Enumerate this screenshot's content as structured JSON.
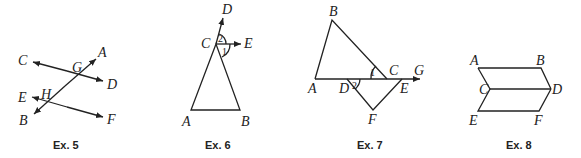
{
  "figures": [
    {
      "id": "ex5",
      "caption": "Ex. 5",
      "description": "Two lines CD and EF crossed by transversal AB at G and H",
      "labels": {
        "A": "A",
        "B": "B",
        "C": "C",
        "D": "D",
        "E": "E",
        "F": "F",
        "G": "G",
        "H": "H"
      }
    },
    {
      "id": "ex6",
      "caption": "Ex. 6",
      "description": "Triangle ABC with ray CD extending AC and ray CE; angles 1 and 2 at C",
      "labels": {
        "A": "A",
        "B": "B",
        "C": "C",
        "D": "D",
        "E": "E"
      },
      "angles": {
        "one": "1",
        "two": "2"
      }
    },
    {
      "id": "ex7",
      "caption": "Ex. 7",
      "description": "Triangle ABC and triangle DEF on ray AG; angle 1 at C, angle 2 at D",
      "labels": {
        "A": "A",
        "B": "B",
        "C": "C",
        "D": "D",
        "E": "E",
        "F": "F",
        "G": "G"
      },
      "angles": {
        "one": "1",
        "two": "2"
      }
    },
    {
      "id": "ex8",
      "caption": "Ex. 8",
      "description": "Two parallelograms ABDC and CDFE sharing side CD",
      "labels": {
        "A": "A",
        "B": "B",
        "C": "C",
        "D": "D",
        "E": "E",
        "F": "F"
      }
    }
  ]
}
